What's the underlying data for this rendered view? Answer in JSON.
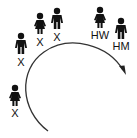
{
  "diagram": {
    "type": "lineage-succession",
    "colors": {
      "figure": "#111111",
      "arc": "#333333",
      "background": "#ffffff"
    },
    "figures": [
      {
        "id": "f1",
        "gender": "male",
        "label": "X",
        "x": 21,
        "y": 33,
        "label_x": 21,
        "label_y": 57
      },
      {
        "id": "f2",
        "gender": "female",
        "label": "X",
        "x": 40,
        "y": 13,
        "label_x": 40,
        "label_y": 37
      },
      {
        "id": "f3",
        "gender": "male",
        "label": "X",
        "x": 57,
        "y": 8,
        "label_x": 57,
        "label_y": 32
      },
      {
        "id": "f4",
        "gender": "female",
        "label": "HW",
        "x": 100,
        "y": 7,
        "label_x": 100,
        "label_y": 30
      },
      {
        "id": "f5",
        "gender": "male",
        "label": "HM",
        "x": 121,
        "y": 18,
        "label_x": 121,
        "label_y": 41
      },
      {
        "id": "f6",
        "gender": "female",
        "label": "X",
        "x": 15,
        "y": 85,
        "label_x": 15,
        "label_y": 108
      }
    ],
    "arc": {
      "direction": "clockwise",
      "has_arrowhead": true
    }
  }
}
